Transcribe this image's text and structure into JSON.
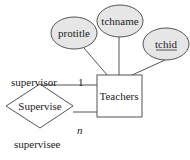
{
  "diagram": {
    "type": "ER diagram",
    "entity": {
      "name": "Teachers"
    },
    "relationship": {
      "name": "Supervise"
    },
    "attributes": [
      {
        "name": "protitle",
        "key": false
      },
      {
        "name": "tchname",
        "key": false
      },
      {
        "name": "tchid",
        "key": true
      }
    ],
    "roles": {
      "top": "supervisor",
      "bottom": "supervisee"
    },
    "cardinalities": {
      "top": "1",
      "bottom": "n"
    },
    "colors": {
      "attribute_fill": "#e6e6e6",
      "stroke": "#444444"
    }
  }
}
